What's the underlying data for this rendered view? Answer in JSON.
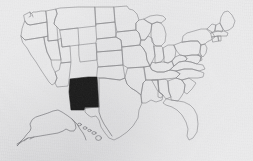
{
  "figure": {
    "kind": "choropleth-locator-map",
    "width": 253,
    "height": 161,
    "background_color": "#ececed",
    "paper_style": "scanned grayscale print",
    "has_visible_text": false,
    "caption": ""
  },
  "legend": {
    "visible": false,
    "entries": [
      {
        "label": "Highlighted state",
        "color": "#1b1b1b"
      },
      {
        "label": "Other states",
        "color": "#ececed"
      }
    ]
  },
  "style": {
    "highlight_fill": "#1b1b1b",
    "state_fill": "#ececed",
    "border_stroke": "#8a8a8d",
    "coast_stroke": "#7e7e82",
    "border_width": 0.62
  },
  "map": {
    "country": "United States of America",
    "projection": "albers-usa",
    "insets": [
      "Alaska",
      "Hawaii"
    ],
    "highlighted_states": [
      "New Mexico"
    ],
    "highlight_bbox": {
      "x": 68,
      "y": 78,
      "width": 32,
      "height": 31
    },
    "regions": [
      {
        "name": "Washington",
        "code": "WA",
        "highlighted": false
      },
      {
        "name": "Oregon",
        "code": "OR",
        "highlighted": false
      },
      {
        "name": "California",
        "code": "CA",
        "highlighted": false
      },
      {
        "name": "Nevada",
        "code": "NV",
        "highlighted": false
      },
      {
        "name": "Idaho",
        "code": "ID",
        "highlighted": false
      },
      {
        "name": "Montana",
        "code": "MT",
        "highlighted": false
      },
      {
        "name": "Wyoming",
        "code": "WY",
        "highlighted": false
      },
      {
        "name": "Utah",
        "code": "UT",
        "highlighted": false
      },
      {
        "name": "Arizona",
        "code": "AZ",
        "highlighted": false
      },
      {
        "name": "Colorado",
        "code": "CO",
        "highlighted": false
      },
      {
        "name": "New Mexico",
        "code": "NM",
        "highlighted": true
      },
      {
        "name": "North Dakota",
        "code": "ND",
        "highlighted": false
      },
      {
        "name": "South Dakota",
        "code": "SD",
        "highlighted": false
      },
      {
        "name": "Nebraska",
        "code": "NE",
        "highlighted": false
      },
      {
        "name": "Kansas",
        "code": "KS",
        "highlighted": false
      },
      {
        "name": "Oklahoma",
        "code": "OK",
        "highlighted": false
      },
      {
        "name": "Texas",
        "code": "TX",
        "highlighted": false
      },
      {
        "name": "Minnesota",
        "code": "MN",
        "highlighted": false
      },
      {
        "name": "Iowa",
        "code": "IA",
        "highlighted": false
      },
      {
        "name": "Missouri",
        "code": "MO",
        "highlighted": false
      },
      {
        "name": "Arkansas",
        "code": "AR",
        "highlighted": false
      },
      {
        "name": "Louisiana",
        "code": "LA",
        "highlighted": false
      },
      {
        "name": "Wisconsin",
        "code": "WI",
        "highlighted": false
      },
      {
        "name": "Illinois",
        "code": "IL",
        "highlighted": false
      },
      {
        "name": "Michigan",
        "code": "MI",
        "highlighted": false
      },
      {
        "name": "Indiana",
        "code": "IN",
        "highlighted": false
      },
      {
        "name": "Ohio",
        "code": "OH",
        "highlighted": false
      },
      {
        "name": "Kentucky",
        "code": "KY",
        "highlighted": false
      },
      {
        "name": "Tennessee",
        "code": "TN",
        "highlighted": false
      },
      {
        "name": "Mississippi",
        "code": "MS",
        "highlighted": false
      },
      {
        "name": "Alabama",
        "code": "AL",
        "highlighted": false
      },
      {
        "name": "Georgia",
        "code": "GA",
        "highlighted": false
      },
      {
        "name": "Florida",
        "code": "FL",
        "highlighted": false
      },
      {
        "name": "South Carolina",
        "code": "SC",
        "highlighted": false
      },
      {
        "name": "North Carolina",
        "code": "NC",
        "highlighted": false
      },
      {
        "name": "Virginia",
        "code": "VA",
        "highlighted": false
      },
      {
        "name": "West Virginia",
        "code": "WV",
        "highlighted": false
      },
      {
        "name": "Maryland",
        "code": "MD",
        "highlighted": false
      },
      {
        "name": "Delaware",
        "code": "DE",
        "highlighted": false
      },
      {
        "name": "Pennsylvania",
        "code": "PA",
        "highlighted": false
      },
      {
        "name": "New Jersey",
        "code": "NJ",
        "highlighted": false
      },
      {
        "name": "New York",
        "code": "NY",
        "highlighted": false
      },
      {
        "name": "Connecticut",
        "code": "CT",
        "highlighted": false
      },
      {
        "name": "Rhode Island",
        "code": "RI",
        "highlighted": false
      },
      {
        "name": "Massachusetts",
        "code": "MA",
        "highlighted": false
      },
      {
        "name": "Vermont",
        "code": "VT",
        "highlighted": false
      },
      {
        "name": "New Hampshire",
        "code": "NH",
        "highlighted": false
      },
      {
        "name": "Maine",
        "code": "ME",
        "highlighted": false
      },
      {
        "name": "Alaska",
        "code": "AK",
        "highlighted": false
      },
      {
        "name": "Hawaii",
        "code": "HI",
        "highlighted": false
      }
    ]
  }
}
